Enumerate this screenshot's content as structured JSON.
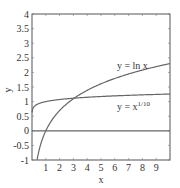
{
  "chart_data": {
    "type": "line",
    "title": "",
    "xlabel": "x",
    "ylabel": "y",
    "xlim": [
      0,
      10
    ],
    "ylim": [
      -1,
      4
    ],
    "grid": false,
    "x_ticks": [
      "1",
      "2",
      "3",
      "4",
      "5",
      "6",
      "7",
      "8",
      "9"
    ],
    "y_ticks": [
      "-1",
      "-0.5",
      "0",
      "0.5",
      "1",
      "1.5",
      "2",
      "2.5",
      "3",
      "3.5",
      "4"
    ],
    "series": [
      {
        "name": "y = ln x",
        "function": "ln(x)",
        "x": [
          0.37,
          0.5,
          1,
          2,
          3,
          4,
          5,
          6,
          7,
          8,
          9,
          10
        ],
        "values": [
          -1.0,
          -0.69,
          0,
          0.69,
          1.1,
          1.39,
          1.61,
          1.79,
          1.95,
          2.08,
          2.2,
          2.3
        ]
      },
      {
        "name": "y = x^(1/10)",
        "function": "x^0.1",
        "x": [
          0.01,
          0.1,
          0.5,
          1,
          2,
          3,
          4,
          5,
          6,
          7,
          8,
          9,
          10
        ],
        "values": [
          0.63,
          0.79,
          0.93,
          1.0,
          1.07,
          1.12,
          1.15,
          1.17,
          1.2,
          1.21,
          1.23,
          1.25,
          1.26
        ]
      },
      {
        "name": "y = 0",
        "function": "0",
        "x": [
          0,
          10
        ],
        "values": [
          0,
          0
        ]
      }
    ],
    "annotations": [
      {
        "text": "y = ln x",
        "x": 5.5,
        "y": 2.1
      },
      {
        "text": "y = x",
        "superscript": "1/10",
        "x": 5.5,
        "y": 0.7
      }
    ]
  }
}
